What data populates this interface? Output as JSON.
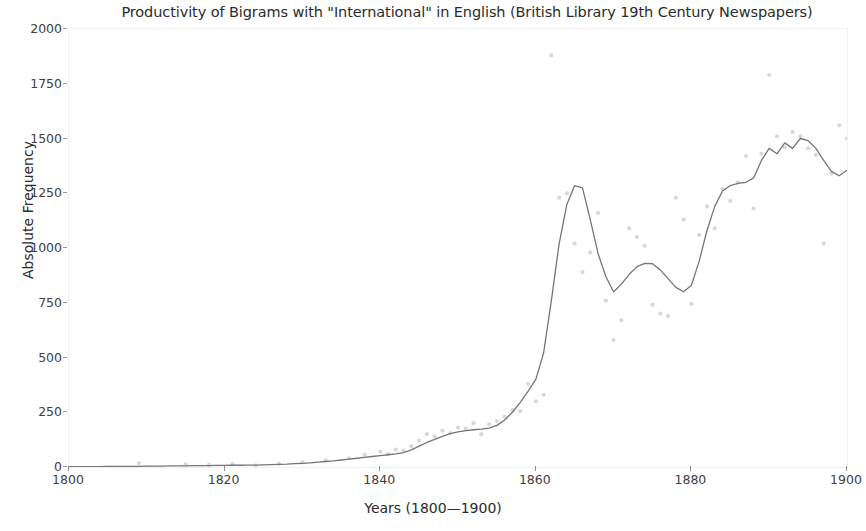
{
  "chart_data": {
    "type": "line",
    "title": "Productivity of Bigrams with \"International\" in English (British Library 19th Century Newspapers)",
    "xlabel": "Years (1800—1900)",
    "ylabel": "Absolute Frequency",
    "xlim": [
      1800,
      1900
    ],
    "ylim": [
      0,
      2000
    ],
    "grid": false,
    "legend": null,
    "xticks": [
      1800,
      1820,
      1840,
      1860,
      1880,
      1900
    ],
    "xtick_labels": [
      "1800",
      "1820",
      "1840",
      "1860",
      "1880",
      "1900"
    ],
    "yticks": [
      0,
      250,
      500,
      750,
      1000,
      1250,
      1500,
      1750,
      2000
    ],
    "ytick_labels": [
      "0",
      "250",
      "500",
      "750",
      "1000",
      "1250",
      "1500",
      "1750",
      "2000"
    ],
    "line_color": "#757575",
    "point_color": "#d8d8d8",
    "series": [
      {
        "name": "Absolute Frequency (trend line)",
        "style": "line",
        "x": [
          1800,
          1801,
          1802,
          1803,
          1804,
          1805,
          1806,
          1807,
          1808,
          1809,
          1810,
          1811,
          1812,
          1813,
          1814,
          1815,
          1816,
          1817,
          1818,
          1819,
          1820,
          1821,
          1822,
          1823,
          1824,
          1825,
          1826,
          1827,
          1828,
          1829,
          1830,
          1831,
          1832,
          1833,
          1834,
          1835,
          1836,
          1837,
          1838,
          1839,
          1840,
          1841,
          1842,
          1843,
          1844,
          1845,
          1846,
          1847,
          1848,
          1849,
          1850,
          1851,
          1852,
          1853,
          1854,
          1855,
          1856,
          1857,
          1858,
          1859,
          1860,
          1861,
          1862,
          1863,
          1864,
          1865,
          1866,
          1867,
          1868,
          1869,
          1870,
          1871,
          1872,
          1873,
          1874,
          1875,
          1876,
          1877,
          1878,
          1879,
          1880,
          1881,
          1882,
          1883,
          1884,
          1885,
          1886,
          1887,
          1888,
          1889,
          1890,
          1891,
          1892,
          1893,
          1894,
          1895,
          1896,
          1897,
          1898,
          1899,
          1900
        ],
        "y": [
          2,
          2,
          2,
          2,
          2,
          3,
          3,
          3,
          3,
          3,
          4,
          4,
          4,
          5,
          5,
          5,
          6,
          6,
          6,
          7,
          7,
          8,
          8,
          9,
          9,
          10,
          11,
          12,
          13,
          15,
          17,
          19,
          22,
          25,
          28,
          32,
          36,
          40,
          44,
          48,
          52,
          56,
          60,
          66,
          78,
          95,
          112,
          126,
          140,
          152,
          160,
          166,
          170,
          173,
          178,
          190,
          215,
          250,
          295,
          345,
          400,
          520,
          760,
          1020,
          1200,
          1285,
          1275,
          1130,
          975,
          870,
          800,
          835,
          880,
          915,
          930,
          928,
          900,
          860,
          820,
          800,
          830,
          940,
          1080,
          1190,
          1260,
          1285,
          1295,
          1300,
          1320,
          1400,
          1455,
          1430,
          1480,
          1455,
          1500,
          1490,
          1455,
          1400,
          1350,
          1330,
          1355
        ]
      },
      {
        "name": "Yearly observations (scatter)",
        "style": "scatter",
        "points": [
          [
            1809,
            18
          ],
          [
            1815,
            12
          ],
          [
            1818,
            10
          ],
          [
            1821,
            14
          ],
          [
            1824,
            8
          ],
          [
            1827,
            15
          ],
          [
            1830,
            22
          ],
          [
            1833,
            30
          ],
          [
            1836,
            40
          ],
          [
            1838,
            55
          ],
          [
            1840,
            70
          ],
          [
            1841,
            60
          ],
          [
            1842,
            80
          ],
          [
            1843,
            75
          ],
          [
            1844,
            95
          ],
          [
            1845,
            120
          ],
          [
            1846,
            150
          ],
          [
            1847,
            140
          ],
          [
            1848,
            165
          ],
          [
            1849,
            155
          ],
          [
            1850,
            180
          ],
          [
            1851,
            175
          ],
          [
            1852,
            200
          ],
          [
            1853,
            150
          ],
          [
            1854,
            195
          ],
          [
            1855,
            210
          ],
          [
            1856,
            230
          ],
          [
            1857,
            260
          ],
          [
            1858,
            255
          ],
          [
            1859,
            380
          ],
          [
            1860,
            300
          ],
          [
            1861,
            330
          ],
          [
            1862,
            1880
          ],
          [
            1863,
            1230
          ],
          [
            1864,
            1250
          ],
          [
            1865,
            1020
          ],
          [
            1866,
            890
          ],
          [
            1867,
            980
          ],
          [
            1868,
            1160
          ],
          [
            1869,
            760
          ],
          [
            1870,
            580
          ],
          [
            1871,
            670
          ],
          [
            1872,
            1090
          ],
          [
            1873,
            1050
          ],
          [
            1874,
            1010
          ],
          [
            1875,
            740
          ],
          [
            1876,
            700
          ],
          [
            1877,
            690
          ],
          [
            1878,
            1230
          ],
          [
            1879,
            1130
          ],
          [
            1880,
            745
          ],
          [
            1881,
            1060
          ],
          [
            1882,
            1190
          ],
          [
            1883,
            1090
          ],
          [
            1884,
            1270
          ],
          [
            1885,
            1215
          ],
          [
            1886,
            1300
          ],
          [
            1887,
            1420
          ],
          [
            1888,
            1180
          ],
          [
            1889,
            1430
          ],
          [
            1890,
            1790
          ],
          [
            1891,
            1510
          ],
          [
            1892,
            1460
          ],
          [
            1893,
            1530
          ],
          [
            1894,
            1510
          ],
          [
            1895,
            1455
          ],
          [
            1896,
            1425
          ],
          [
            1897,
            1020
          ],
          [
            1898,
            1340
          ],
          [
            1899,
            1560
          ],
          [
            1900,
            1500
          ]
        ]
      }
    ]
  }
}
